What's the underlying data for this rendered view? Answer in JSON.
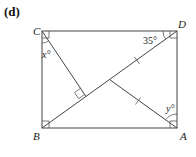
{
  "figure": {
    "part_label": "(d)",
    "vertices": {
      "C": {
        "label": "C",
        "x": 42,
        "y": 31
      },
      "D": {
        "label": "D",
        "x": 177,
        "y": 31
      },
      "B": {
        "label": "B",
        "x": 42,
        "y": 128
      },
      "A": {
        "label": "A",
        "x": 177,
        "y": 128
      }
    },
    "angles": {
      "x": {
        "label": "x°"
      },
      "y": {
        "label": "y°"
      },
      "d": {
        "label": "35°"
      }
    },
    "colors": {
      "stroke": "#444444",
      "text": "#222222",
      "background": "#ffffff"
    }
  }
}
